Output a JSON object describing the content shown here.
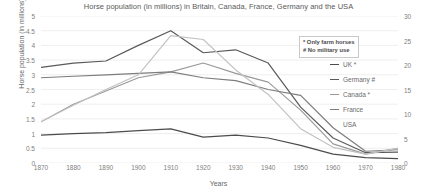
{
  "chart_data": {
    "type": "line",
    "title": "Horse population (in millions) in Britain, Canada, France, Germany and the USA",
    "xlabel": "Years",
    "ylabel": "Horse population (in millions)",
    "grid": true,
    "legend_position": "right",
    "x": [
      1870,
      1880,
      1890,
      1900,
      1910,
      1920,
      1930,
      1940,
      1950,
      1960,
      1970,
      1980
    ],
    "xlim": [
      1870,
      1980
    ],
    "xticks": [
      "1870",
      "1880",
      "1890",
      "1900",
      "1910",
      "1920",
      "1930",
      "1940",
      "1950",
      "1960",
      "1970",
      "1980"
    ],
    "ylim": [
      0,
      5
    ],
    "yticks": [
      "0",
      "0.5",
      "1",
      "1.5",
      "2",
      "2.5",
      "3",
      "3.5",
      "4",
      "4.5",
      "5"
    ],
    "y2label": "",
    "y2lim": [
      0,
      30
    ],
    "y2ticks": [
      "0",
      "5",
      "10",
      "15",
      "20",
      "25",
      "30"
    ],
    "annotations": [
      "* Only farm horses",
      "# No military use"
    ],
    "series": [
      {
        "name": "UK *",
        "axis": "left",
        "color": "#4c4c4c",
        "values": [
          0.95,
          1.0,
          1.03,
          1.1,
          1.16,
          0.88,
          0.95,
          0.85,
          0.6,
          0.3,
          0.18,
          0.15
        ]
      },
      {
        "name": "Germany #",
        "axis": "left",
        "color": "#5a5a5a",
        "values": [
          3.25,
          3.4,
          3.47,
          4.0,
          4.5,
          3.75,
          3.85,
          3.4,
          1.9,
          0.85,
          0.35,
          0.37
        ]
      },
      {
        "name": "Canada *",
        "axis": "left",
        "color": "#9a9a9a",
        "values": [
          1.4,
          2.0,
          2.45,
          2.9,
          3.1,
          3.4,
          3.05,
          2.75,
          1.8,
          0.65,
          0.3,
          0.5
        ]
      },
      {
        "name": "France",
        "axis": "left",
        "color": "#7d7d7d",
        "values": [
          2.9,
          2.95,
          3.0,
          3.05,
          3.1,
          2.9,
          2.8,
          2.5,
          2.3,
          1.2,
          0.4,
          0.45
        ]
      },
      {
        "name": "USA",
        "axis": "right",
        "color": "#c2c2c2",
        "values": [
          8.4,
          11.8,
          15.0,
          18.0,
          26.0,
          25.2,
          19.0,
          14.0,
          7.0,
          3.2,
          1.8,
          3.0
        ]
      }
    ]
  }
}
